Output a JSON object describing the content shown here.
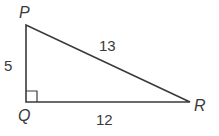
{
  "diagram": {
    "type": "right-triangle",
    "stroke_color": "#3a3a3a",
    "vertices": [
      {
        "name": "P",
        "x": 26,
        "y": 25
      },
      {
        "name": "Q",
        "x": 26,
        "y": 102
      },
      {
        "name": "R",
        "x": 190,
        "y": 102
      }
    ],
    "right_angle_at": "Q",
    "labels": {
      "P": "P",
      "Q": "Q",
      "R": "R"
    },
    "sides": {
      "PQ": "5",
      "PR": "13",
      "QR": "12"
    }
  }
}
